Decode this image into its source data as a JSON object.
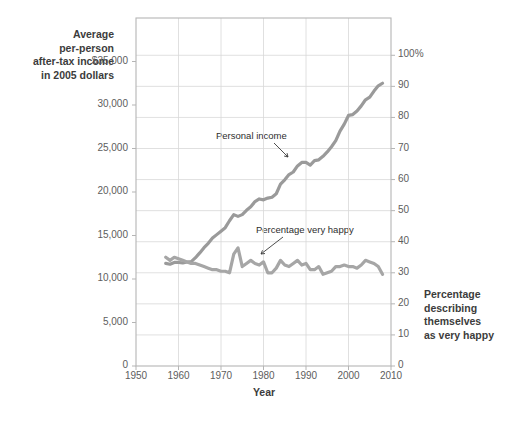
{
  "chart_data": {
    "type": "line",
    "title": "",
    "xlabel": "Year",
    "ylabel_left": "Average per-person after-tax income in 2005 dollars",
    "ylabel_right": "Percentage describing themselves as very happy",
    "xlim": [
      1950,
      2010
    ],
    "ylim_left": [
      0,
      40000
    ],
    "ylim_right": [
      0,
      112
    ],
    "grid": true,
    "legend_position": "inline-annotations",
    "left_axis_ticks": [
      "$35,000",
      "30,000",
      "25,000",
      "20,000",
      "15,000",
      "10,000",
      "5,000",
      "0"
    ],
    "left_axis_tick_values": [
      35000,
      30000,
      25000,
      20000,
      15000,
      10000,
      5000,
      0
    ],
    "right_axis_ticks": [
      "100%",
      "90",
      "80",
      "70",
      "60",
      "50",
      "40",
      "30",
      "20",
      "10",
      "0"
    ],
    "right_axis_tick_values": [
      100,
      90,
      80,
      70,
      60,
      50,
      40,
      30,
      20,
      10,
      0
    ],
    "x_axis_ticks": [
      "1950",
      "1960",
      "1970",
      "1980",
      "1990",
      "2000",
      "2010"
    ],
    "x_axis_tick_values": [
      1950,
      1960,
      1970,
      1980,
      1990,
      2000,
      2010
    ],
    "series": [
      {
        "name": "Personal income",
        "axis": "left",
        "color": "#9a9a9a",
        "annotation": "Personal income",
        "x": [
          1957,
          1958,
          1959,
          1960,
          1961,
          1962,
          1963,
          1964,
          1965,
          1966,
          1967,
          1968,
          1969,
          1970,
          1971,
          1972,
          1973,
          1974,
          1975,
          1976,
          1977,
          1978,
          1979,
          1980,
          1981,
          1982,
          1983,
          1984,
          1985,
          1986,
          1987,
          1988,
          1989,
          1990,
          1991,
          1992,
          1993,
          1994,
          1995,
          1996,
          1997,
          1998,
          1999,
          2000,
          2001,
          2002,
          2003,
          2004,
          2005,
          2006,
          2007,
          2008
        ],
        "values": [
          11800,
          11700,
          11900,
          11900,
          11850,
          11950,
          12000,
          12450,
          13000,
          13600,
          14100,
          14700,
          15100,
          15500,
          15900,
          16700,
          17400,
          17200,
          17400,
          17900,
          18300,
          18900,
          19200,
          19100,
          19300,
          19400,
          19800,
          20900,
          21400,
          22000,
          22300,
          23000,
          23400,
          23400,
          23100,
          23600,
          23700,
          24100,
          24600,
          25200,
          25900,
          27000,
          27800,
          28800,
          28900,
          29300,
          29900,
          30600,
          30900,
          31600,
          32200,
          32500
        ]
      },
      {
        "name": "Percentage very happy",
        "axis": "right",
        "color": "#a6a6a6",
        "annotation": "Percentage very happy",
        "x": [
          1957,
          1958,
          1959,
          1960,
          1961,
          1962,
          1963,
          1964,
          1965,
          1966,
          1967,
          1968,
          1969,
          1970,
          1971,
          1972,
          1973,
          1974,
          1975,
          1976,
          1977,
          1978,
          1979,
          1980,
          1981,
          1982,
          1983,
          1984,
          1985,
          1986,
          1987,
          1988,
          1989,
          1990,
          1991,
          1992,
          1993,
          1994,
          1995,
          1996,
          1997,
          1998,
          1999,
          2000,
          2001,
          2002,
          2003,
          2004,
          2005,
          2006,
          2007,
          2008
        ],
        "values": [
          35,
          34,
          35,
          34.5,
          34,
          33.5,
          33,
          33,
          32.5,
          32,
          31.5,
          31,
          31,
          30.5,
          30.5,
          30,
          36,
          38,
          32,
          33,
          34,
          33,
          32.5,
          33.5,
          30,
          30,
          31.5,
          34,
          32.5,
          32,
          33,
          34,
          32.5,
          33,
          31,
          31,
          32,
          29.5,
          30,
          30.5,
          32,
          32,
          32.5,
          32,
          32,
          31.5,
          32.5,
          34,
          33.5,
          33,
          32,
          29.5
        ]
      }
    ]
  },
  "annotations": {
    "income_label": "Personal income",
    "happy_label": "Percentage very happy"
  },
  "labels": {
    "x_axis_title": "Year",
    "y_left_line1": "Average",
    "y_left_line2": "per-person",
    "y_left_line3": "after-tax income",
    "y_left_line4": "in 2005 dollars",
    "y_right_line1": "Percentage",
    "y_right_line2": "describing",
    "y_right_line3": "themselves",
    "y_right_line4": "as very happy"
  },
  "colors": {
    "line": "#9e9e9e",
    "grid": "#d8d8d8",
    "frame": "#b5b5b5",
    "text": "#4a4a4a",
    "leader": "#3a3a3a"
  }
}
